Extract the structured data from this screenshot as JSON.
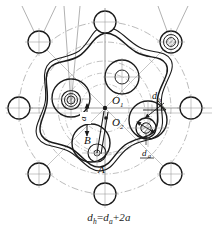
{
  "figure": {
    "caption": {
      "lhs_symbol": "d",
      "lhs_sub": "h",
      "equals": "=",
      "rhs_symbol": "d",
      "rhs_sub": "a",
      "plus": "+",
      "term": "2a",
      "full_text": "dh = da + 2a"
    },
    "labels": {
      "center_o1": "O",
      "center_o1_sub": "1",
      "center_o2": "O",
      "center_o2_sub": "2",
      "point_a": "A",
      "point_b": "B",
      "eccentricity": "a",
      "pin_pitch_dia": "d",
      "pin_pitch_dia_sub": "h",
      "pin_dia": "d",
      "pin_dia_sub": "a"
    },
    "colors": {
      "outline": "#1a1a1a",
      "construction": "#8c8c8c",
      "centerline": "#9a9a9a",
      "background": "#ffffff",
      "hatch": "#4a4a4a"
    },
    "geometry": {
      "lobe_count": 8,
      "pin_count": 8,
      "pin_circle_radius_px": 86,
      "pin_radius_px": 11,
      "roller_count": 4,
      "roller_radius_px": 17,
      "disc_center_x": 105,
      "disc_center_y": 108,
      "eccentricity_px": 7
    }
  }
}
